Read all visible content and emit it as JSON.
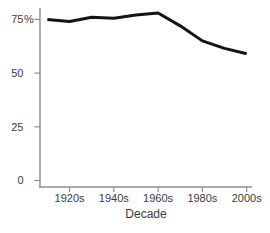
{
  "chart_data": {
    "type": "line",
    "title": "",
    "xlabel": "Decade",
    "ylabel": "",
    "categories": [
      "1910s",
      "1920s",
      "1930s",
      "1940s",
      "1950s",
      "1960s",
      "1970s",
      "1980s",
      "1990s",
      "2000s"
    ],
    "values": [
      75,
      74,
      76,
      75.5,
      77,
      78,
      72,
      65,
      61.5,
      59
    ],
    "series": [
      {
        "name": "percentage",
        "values": [
          75,
          74,
          76,
          75.5,
          77,
          78,
          72,
          65,
          61.5,
          59
        ]
      }
    ],
    "x_tick_labels": [
      "1920s",
      "1940s",
      "1960s",
      "1980s",
      "2000s"
    ],
    "y_ticks": [
      {
        "value": 75,
        "label": "75",
        "suffix": "%"
      },
      {
        "value": 50,
        "label": "50",
        "suffix": ""
      },
      {
        "value": 25,
        "label": "25",
        "suffix": ""
      },
      {
        "value": 0,
        "label": "0",
        "suffix": ""
      }
    ],
    "ylim": [
      0,
      80
    ],
    "grid": false,
    "legend_position": "none",
    "line_color": "#141414",
    "axis_color": "#8e8e8e",
    "label_color": "#3b3b3b"
  }
}
